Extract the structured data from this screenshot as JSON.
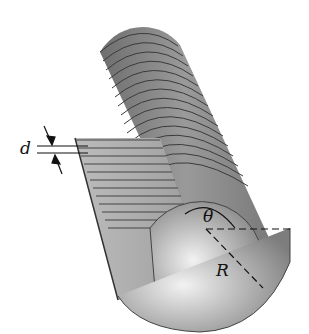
{
  "figure": {
    "labels": {
      "plate_spacing": "d",
      "overlap_angle": "θ",
      "radius": "R"
    },
    "colors": {
      "background": "#ffffff",
      "plate_dark": "#5a5a5a",
      "plate_mid": "#8c8c8c",
      "plate_light": "#d8d8d8",
      "line": "#111111"
    }
  }
}
